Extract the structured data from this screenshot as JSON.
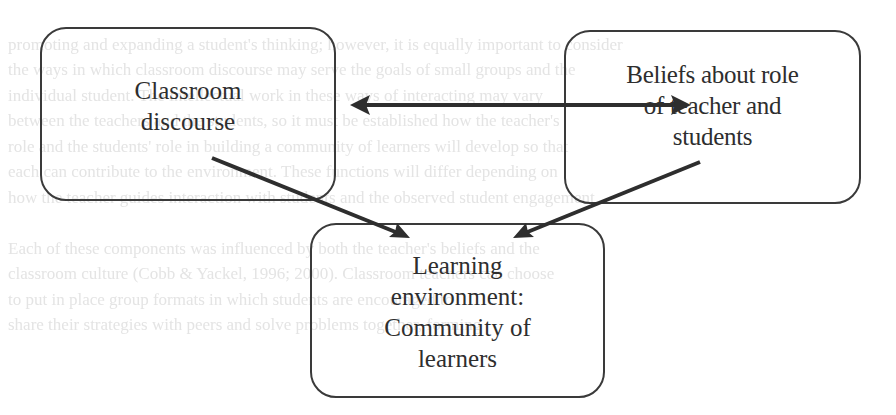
{
  "diagram": {
    "type": "concept-map",
    "nodes": [
      {
        "id": "classroom",
        "label_line1": "Classroom",
        "label_line2": "discourse"
      },
      {
        "id": "beliefs",
        "label_line1": "Beliefs about role",
        "label_line2": "of teacher and",
        "label_line3": "students"
      },
      {
        "id": "learning",
        "label_line1": "Learning",
        "label_line2": "environment:",
        "label_line3": "Community of",
        "label_line4": "learners"
      }
    ],
    "edges": [
      {
        "from": "classroom",
        "to": "beliefs",
        "direction": "bidirectional"
      },
      {
        "from": "classroom",
        "to": "learning",
        "direction": "forward"
      },
      {
        "from": "beliefs",
        "to": "learning",
        "direction": "forward"
      }
    ],
    "colors": {
      "stroke": "#2e2e2e",
      "text": "#2e2e2e",
      "background": "#ffffff",
      "bleed_through_text": "#e4e4e4"
    }
  },
  "background_bleed": {
    "lines": [
      "                                                                                                  ",
      "      promoting and expanding a student's thinking; however, it is equally important to consider",
      "      the ways in which classroom discourse may serve the goals of small groups and the",
      "      individual student. The intellectual work in these ways of interacting may vary",
      "      between the teachers and the students, so it must be established how the teacher's",
      "      role and the students' role in building a community of learners will develop so that",
      "      each can contribute to the environment. These functions will differ depending on",
      "      how the teacher guides interaction with students and the observed student engagement.",
      "      ",
      "      Each of these components was influenced by both the teacher's beliefs and the",
      "      classroom culture (Cobb & Yackel, 1996; 2000). Classroom teachers can choose",
      "      to put in place group formats in which students are encouraged to",
      "      share their strategies with peers and solve problems together, forming"
    ]
  }
}
